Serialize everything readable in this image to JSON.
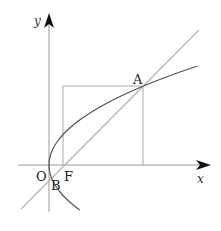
{
  "diagram": {
    "type": "parabola-focal-chord",
    "colors": {
      "background": "#ffffff",
      "axes": "#9a9a9a",
      "line": "#b0b0b0",
      "box": "#a8a8a8",
      "parabola": "#555555",
      "text": "#222222"
    },
    "axes": {
      "x_label": "x",
      "y_label": "y",
      "origin_label": "O"
    },
    "points": [
      {
        "id": "O",
        "label": "O",
        "description": "origin / vertex of parabola"
      },
      {
        "id": "F",
        "label": "F",
        "description": "focus on x-axis"
      },
      {
        "id": "A",
        "label": "A",
        "description": "upper intersection of line and parabola"
      },
      {
        "id": "B",
        "label": "B",
        "description": "lower intersection of line and parabola"
      }
    ],
    "elements": [
      "x-axis with arrow",
      "y-axis with arrow",
      "parabola opening right (y^2 = 2px)",
      "straight line through focus F at 45 degrees, intersecting parabola at A and B",
      "rectangle with corners at A and on axes, left side x = x_F"
    ]
  }
}
